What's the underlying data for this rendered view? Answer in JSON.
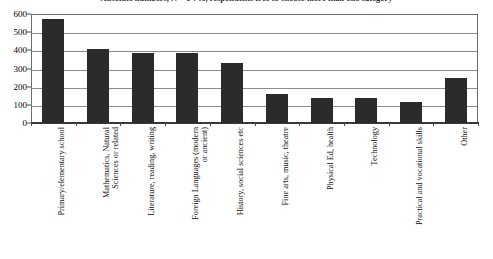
{
  "chart_data": {
    "type": "bar",
    "title": "Absolute numbers, N = 1 746, respondents free to choose more than one category",
    "xlabel": "",
    "ylabel": "",
    "ylim": [
      0,
      600
    ],
    "ytick_step": 100,
    "ytick_labels": [
      "600",
      "500",
      "400",
      "300",
      "200",
      "100",
      "0"
    ],
    "ytick_values": [
      600,
      500,
      400,
      300,
      200,
      100,
      0
    ],
    "grid": true,
    "legend": "none",
    "bar_color": "#2b2b2b",
    "categories": [
      "Primary/elementary school",
      "Mathematics, Natural\nSciences or related",
      "Literature, reading, writing",
      "Foreign Languages (modern\nor ancient)",
      "History, social sciences etc",
      "Fine arts, music, theatre",
      "Physical Ed, health",
      "Technology",
      "Practical and vocational skills",
      "Other"
    ],
    "values": [
      570,
      405,
      385,
      385,
      330,
      160,
      135,
      135,
      115,
      250
    ]
  },
  "colors": {
    "bar": "#2b2b2b",
    "grid": "#8c8c8c",
    "frame": "#6d6d6d",
    "text": "#0f0f0f",
    "background": "#ffffff"
  }
}
